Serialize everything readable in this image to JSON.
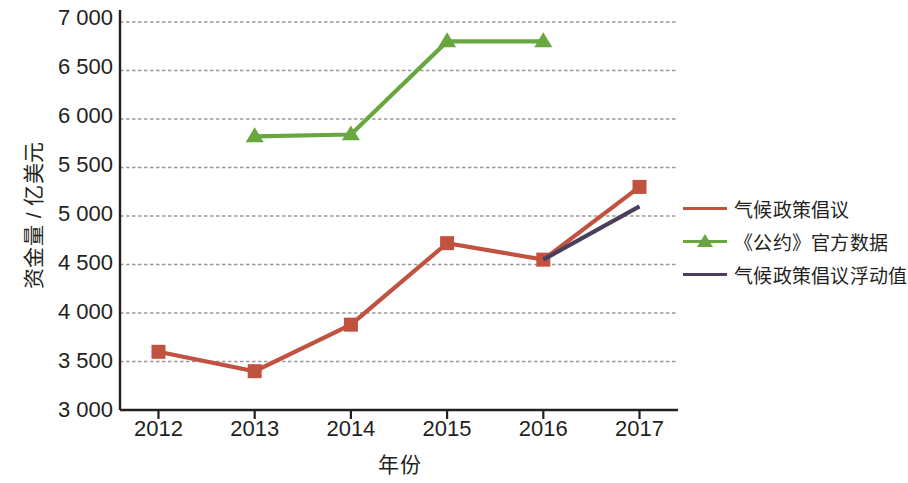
{
  "chart_data": {
    "type": "line",
    "title": "",
    "xlabel": "年份",
    "ylabel": "资金量 / 亿美元",
    "categories": [
      "2012",
      "2013",
      "2014",
      "2015",
      "2016",
      "2017"
    ],
    "x": [
      2012,
      2013,
      2014,
      2015,
      2016,
      2017
    ],
    "xlim": [
      2011.6,
      2017.4
    ],
    "ylim": [
      3000,
      7000
    ],
    "yticks": [
      "3 000",
      "3 500",
      "4 000",
      "4 500",
      "5 000",
      "5 500",
      "6 000",
      "6 500",
      "7 000"
    ],
    "ytick_values": [
      3000,
      3500,
      4000,
      4500,
      5000,
      5500,
      6000,
      6500,
      7000
    ],
    "grid": true,
    "grid_style": "dashed",
    "legend_position": "right",
    "series": [
      {
        "name": "气候政策倡议",
        "color": "#c1523f",
        "marker": "square",
        "x": [
          2012,
          2013,
          2014,
          2015,
          2016,
          2017
        ],
        "values": [
          3600,
          3400,
          3880,
          4720,
          4550,
          5300
        ]
      },
      {
        "name": "《公约》官方数据",
        "color": "#68a73f",
        "marker": "triangle",
        "x": [
          2013,
          2014,
          2015,
          2016
        ],
        "values": [
          5820,
          5840,
          6800,
          6800
        ]
      },
      {
        "name": "气候政策倡议浮动值",
        "color": "#4c3f5e",
        "marker": "none",
        "x": [
          2016,
          2017
        ],
        "values": [
          4550,
          5100
        ]
      }
    ]
  },
  "axis": {
    "y_title": "资金量 / 亿美元",
    "x_title": "年份"
  },
  "legend": {
    "items": [
      {
        "label": "气候政策倡议",
        "color": "#c1523f",
        "marker": "square"
      },
      {
        "label": "《公约》官方数据",
        "color": "#68a73f",
        "marker": "triangle"
      },
      {
        "label": "气候政策倡议浮动值",
        "color": "#4c3f5e",
        "marker": "none"
      }
    ]
  },
  "colors": {
    "series_red": "#c1523f",
    "series_green": "#68a73f",
    "series_purple": "#4c3f5e",
    "axis": "#231f20",
    "grid": "#9a9a9a",
    "background": "#ffffff"
  }
}
